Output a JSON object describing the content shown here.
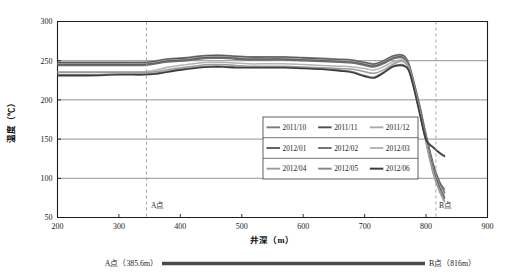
{
  "figure": {
    "background": "#ffffff",
    "width": 509,
    "height": 277
  },
  "axes": {
    "y_title": "温度（℃）",
    "x_title": "井深（m）",
    "y_ticks": [
      "50",
      "100",
      "150",
      "200",
      "250",
      "300"
    ],
    "x_ticks": [
      "200",
      "300",
      "400",
      "500",
      "600",
      "700",
      "800",
      "900"
    ]
  },
  "markers": {
    "a_label": "A点",
    "b_label": "B点",
    "a_depth": 345,
    "b_depth": 816
  },
  "caption": {
    "left": "A点（385.6m）",
    "right": "B点（816m）"
  },
  "legend": {
    "rows": [
      [
        "2011/10",
        "2011/11",
        "2011/12"
      ],
      [
        "2012/01",
        "2012/02",
        "2012/03"
      ],
      [
        "2012/04",
        "2012/05",
        "2012/06"
      ]
    ]
  },
  "chart_data": {
    "type": "line",
    "title": "",
    "xlabel": "井深（m）",
    "ylabel": "温度（℃）",
    "xlim": [
      200,
      900
    ],
    "ylim": [
      50,
      300
    ],
    "xtick_step": 100,
    "ytick_step": 50,
    "grid": "horizontal",
    "legend_position": "center-right-inside",
    "annotations": [
      {
        "label": "A点",
        "x": 345,
        "type": "vertical-dashed-line"
      },
      {
        "label": "B点",
        "x": 816,
        "type": "vertical-dashed-line"
      }
    ],
    "x": [
      200,
      250,
      300,
      340,
      360,
      375,
      390,
      410,
      430,
      450,
      470,
      490,
      510,
      540,
      570,
      600,
      630,
      660,
      680,
      700,
      715,
      730,
      745,
      757,
      765,
      772,
      780,
      790,
      800,
      812,
      822,
      830
    ],
    "series": [
      {
        "name": "2011/10",
        "color": "#7c7c7c",
        "width": 1.5,
        "values": [
          248,
          248,
          248,
          248,
          250,
          252,
          253,
          254,
          256,
          257,
          257,
          256,
          255,
          255,
          255,
          254,
          253,
          252,
          251,
          248,
          246,
          250,
          256,
          258,
          256,
          246,
          224,
          192,
          156,
          118,
          96,
          86
        ]
      },
      {
        "name": "2011/11",
        "color": "#4d4d4d",
        "width": 1.5,
        "values": [
          247,
          247,
          247,
          247,
          249,
          251,
          252,
          253,
          255,
          256,
          256,
          255,
          254,
          254,
          254,
          253,
          252,
          251,
          250,
          247,
          245,
          249,
          255,
          257,
          255,
          245,
          222,
          190,
          154,
          115,
          93,
          82
        ]
      },
      {
        "name": "2011/12",
        "color": "#aaaaaa",
        "width": 1.5,
        "values": [
          246,
          246,
          246,
          246,
          248,
          250,
          251,
          252,
          254,
          255,
          255,
          254,
          253,
          253,
          253,
          252,
          251,
          250,
          249,
          246,
          244,
          248,
          254,
          256,
          254,
          244,
          221,
          188,
          152,
          113,
          91,
          80
        ]
      },
      {
        "name": "2012/01",
        "color": "#5a5a5a",
        "width": 1.5,
        "values": [
          245,
          245,
          245,
          245,
          247,
          249,
          250,
          251,
          253,
          254,
          254,
          253,
          252,
          252,
          252,
          251,
          250,
          249,
          248,
          245,
          243,
          247,
          253,
          255,
          253,
          243,
          220,
          187,
          150,
          110,
          88,
          76
        ]
      },
      {
        "name": "2012/02",
        "color": "#6e6e6e",
        "width": 1.5,
        "values": [
          244,
          244,
          244,
          244,
          246,
          248,
          249,
          250,
          252,
          253,
          253,
          252,
          251,
          251,
          251,
          250,
          249,
          248,
          247,
          244,
          242,
          246,
          252,
          254,
          252,
          242,
          219,
          185,
          148,
          108,
          86,
          74
        ]
      },
      {
        "name": "2012/03",
        "color": "#b4b4b4",
        "width": 1.5,
        "values": [
          236,
          236,
          236,
          236,
          238,
          241,
          243,
          245,
          247,
          248,
          248,
          247,
          246,
          246,
          246,
          245,
          244,
          243,
          242,
          240,
          238,
          242,
          248,
          251,
          250,
          241,
          218,
          184,
          146,
          106,
          84,
          71
        ]
      },
      {
        "name": "2012/04",
        "color": "#9d9d9d",
        "width": 1.5,
        "values": [
          235,
          235,
          235,
          235,
          236,
          238,
          240,
          242,
          244,
          245,
          245,
          244,
          243,
          243,
          243,
          242,
          241,
          240,
          239,
          236,
          234,
          238,
          245,
          249,
          248,
          240,
          217,
          183,
          145,
          105,
          83,
          70
        ]
      },
      {
        "name": "2012/05",
        "color": "#858585",
        "width": 1.5,
        "values": [
          232,
          232,
          233,
          233,
          234,
          236,
          238,
          240,
          242,
          243,
          243,
          242,
          242,
          242,
          242,
          241,
          240,
          238,
          236,
          231,
          229,
          235,
          243,
          245,
          244,
          238,
          216,
          182,
          150,
          140,
          133,
          129
        ]
      },
      {
        "name": "2012/06",
        "color": "#3c3c3c",
        "width": 1.6,
        "values": [
          231,
          231,
          232,
          232,
          233,
          235,
          237,
          239,
          241,
          242,
          242,
          241,
          241,
          241,
          241,
          240,
          239,
          237,
          235,
          230,
          228,
          234,
          242,
          244,
          243,
          237,
          215,
          181,
          149,
          139,
          132,
          128
        ]
      }
    ]
  }
}
